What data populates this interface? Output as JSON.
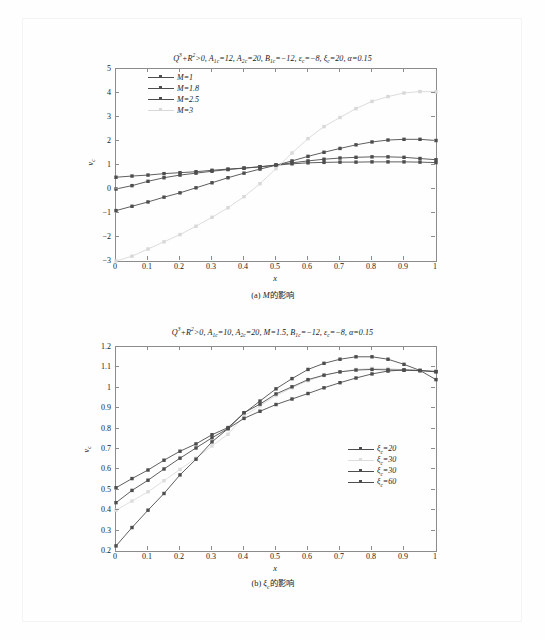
{
  "page": {
    "figures": [
      {
        "id": "figure-a",
        "title_html": "<span class=\"ital\">Q</span><sup>3</sup>+<span class=\"ital\">R</span><sup>2</sup>&gt;0, <span class=\"ital\">A</span><sub>1c</sub>=12, <span class=\"ital\">A</span><sub>2c</sub>=20, <span class=\"ital\">B</span><sub>1c</sub>=−12, <span class=\"ital\">ε</span><sub>c</sub>=−8, <span class=\"ital\">ξ</span><sub>c</sub>=20, <span class=\"ital\">α</span>=0.15",
        "caption_html": "(a) <span class=\"ital\">M</span>的影响",
        "xlabel_html": "<span class=\"ital\">x</span>",
        "ylabel_html": "<span class=\"ital\">v</span><sub>c</sub>"
      },
      {
        "id": "figure-b",
        "title_html": "<span class=\"ital\">Q</span><sup>3</sup>+<span class=\"ital\">R</span><sup>2</sup>&gt;0, <span class=\"ital\">A</span><sub>1c</sub>=10, <span class=\"ital\">A</span><sub>2c</sub>=20, <span class=\"ital\">M</span>=1.5, <span class=\"ital\">B</span><sub>1c</sub>=−12, <span class=\"ital\">ε</span><sub>c</sub>=−8, <span class=\"ital\">α</span>=0.15",
        "caption_html": "(b) <span class=\"ital\">ξ</span><sub>c</sub>的影响",
        "xlabel_html": "<span class=\"ital\">x</span>",
        "ylabel_html": "<span class=\"ital\">v</span><sub>c</sub>"
      }
    ]
  },
  "chart_data": [
    {
      "type": "line",
      "id": "chart-a",
      "title": "Q3+R2>0, A1c=12, A2c=20, B1c=-12, epsilon_c=-8, xi_c=20, alpha=0.15",
      "caption": "(a) M的影响",
      "xlabel": "x",
      "ylabel": "v_c",
      "xlim": [
        0,
        1
      ],
      "ylim": [
        -3,
        5
      ],
      "xticks": [
        "0",
        "0.1",
        "0.2",
        "0.3",
        "0.4",
        "0.5",
        "0.6",
        "0.7",
        "0.8",
        "0.9",
        "1"
      ],
      "yticks": [
        "5",
        "4",
        "3",
        "2",
        "1",
        "0",
        "-1",
        "-2",
        "-3"
      ],
      "grid": false,
      "legend_position": "upper-left",
      "markers": "filled-square-circle",
      "x": [
        0,
        0.05,
        0.1,
        0.15,
        0.2,
        0.25,
        0.3,
        0.35,
        0.4,
        0.45,
        0.5,
        0.55,
        0.6,
        0.65,
        0.7,
        0.75,
        0.8,
        0.85,
        0.9,
        0.95,
        1.0
      ],
      "series": [
        {
          "name": "M=1",
          "color": "#4d4d4d",
          "style": "solid",
          "values": [
            0.49,
            0.54,
            0.58,
            0.64,
            0.68,
            0.72,
            0.78,
            0.83,
            0.87,
            0.92,
            0.99,
            1.05,
            1.09,
            1.11,
            1.12,
            1.12,
            1.13,
            1.13,
            1.13,
            1.12,
            1.1
          ]
        },
        {
          "name": "M=1.8",
          "color": "#4d4d4d",
          "style": "solid",
          "values": [
            0.0,
            0.14,
            0.32,
            0.47,
            0.58,
            0.66,
            0.74,
            0.81,
            0.87,
            0.93,
            1.0,
            1.09,
            1.17,
            1.24,
            1.29,
            1.32,
            1.34,
            1.34,
            1.32,
            1.27,
            1.22
          ]
        },
        {
          "name": "M=2.5",
          "color": "#4d4d4d",
          "style": "solid",
          "values": [
            -0.9,
            -0.72,
            -0.54,
            -0.34,
            -0.16,
            0.05,
            0.26,
            0.47,
            0.66,
            0.83,
            0.99,
            1.17,
            1.36,
            1.53,
            1.69,
            1.84,
            1.96,
            2.04,
            2.07,
            2.07,
            2.02
          ]
        },
        {
          "name": "M=3",
          "color": "#d8d8d8",
          "style": "solid-light",
          "values": [
            -3.0,
            -2.8,
            -2.5,
            -2.2,
            -1.9,
            -1.55,
            -1.18,
            -0.78,
            -0.32,
            0.22,
            0.85,
            1.5,
            2.1,
            2.6,
            2.98,
            3.35,
            3.65,
            3.85,
            4.0,
            4.06,
            4.05
          ]
        }
      ]
    },
    {
      "type": "line",
      "id": "chart-b",
      "title": "Q3+R2>0, A1c=10, A2c=20, M=1.5, B1c=-12, epsilon_c=-8, alpha=0.15",
      "caption": "(b) ξ_c的影响",
      "xlabel": "x",
      "ylabel": "v_c",
      "xlim": [
        0,
        1
      ],
      "ylim": [
        0.2,
        1.2
      ],
      "xticks": [
        "0",
        "0.1",
        "0.2",
        "0.3",
        "0.4",
        "0.5",
        "0.6",
        "0.7",
        "0.8",
        "0.9",
        "1"
      ],
      "yticks": [
        "1.2",
        "1.1",
        "1",
        "0.9",
        "0.8",
        "0.7",
        "0.6",
        "0.5",
        "0.4",
        "0.3",
        "0.2"
      ],
      "grid": false,
      "legend_position": "right-middle",
      "markers": "filled-square-circle",
      "x": [
        0,
        0.05,
        0.1,
        0.15,
        0.2,
        0.25,
        0.3,
        0.35,
        0.4,
        0.45,
        0.5,
        0.55,
        0.6,
        0.65,
        0.7,
        0.75,
        0.8,
        0.85,
        0.9,
        0.95,
        1.0
      ],
      "series": [
        {
          "name": "ξ_c=20",
          "color": "#4d4d4d",
          "style": "solid",
          "values": [
            0.51,
            0.555,
            0.597,
            0.645,
            0.689,
            0.725,
            0.77,
            0.805,
            0.875,
            0.935,
            0.995,
            1.045,
            1.09,
            1.12,
            1.14,
            1.152,
            1.152,
            1.14,
            1.115,
            1.085,
            1.04
          ]
        },
        {
          "name": "ξ_c=30",
          "color": "#dcdcdc",
          "style": "solid-light",
          "values": [
            0.4,
            0.445,
            0.49,
            0.545,
            0.6,
            0.655,
            0.715,
            0.772,
            0.862,
            0.912,
            0.962,
            1.0,
            1.035,
            1.06,
            1.078,
            1.09,
            1.095,
            1.095,
            1.088,
            1.085,
            1.082
          ]
        },
        {
          "name": "ξ_c=30",
          "color": "#4d4d4d",
          "style": "solid",
          "values": [
            0.437,
            0.497,
            0.547,
            0.602,
            0.655,
            0.705,
            0.755,
            0.8,
            0.878,
            0.92,
            0.97,
            1.005,
            1.04,
            1.062,
            1.078,
            1.087,
            1.09,
            1.088,
            1.086,
            1.084,
            1.08
          ]
        },
        {
          "name": "ξ_c=60",
          "color": "#4d4d4d",
          "style": "solid",
          "values": [
            0.225,
            0.315,
            0.4,
            0.482,
            0.573,
            0.65,
            0.735,
            0.8,
            0.85,
            0.885,
            0.918,
            0.945,
            0.972,
            1.0,
            1.025,
            1.048,
            1.068,
            1.082,
            1.088,
            1.085,
            1.078
          ]
        }
      ]
    }
  ]
}
